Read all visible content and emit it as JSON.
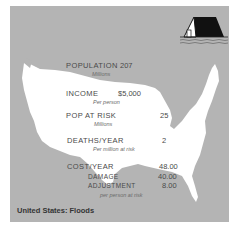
{
  "title": "United States: Floods",
  "icon": "flooded-house-icon",
  "colors": {
    "background": "#b4b4b4",
    "map": "#ffffff",
    "text": "#4a4a4a"
  },
  "stats": {
    "population": {
      "label": "POPULATION",
      "sub": "Millions",
      "value": "207"
    },
    "income": {
      "label": "INCOME",
      "sub": "Per person",
      "value": "$5,000"
    },
    "pop_at_risk": {
      "label": "POP AT RISK",
      "sub": "Millions",
      "value": "25"
    },
    "deaths": {
      "label": "DEATHS/YEAR",
      "sub": "Per million at risk",
      "value": "2"
    },
    "cost": {
      "label": "COST/YEAR",
      "value": "48.00"
    },
    "damage": {
      "label": "DAMAGE",
      "value": "40.00"
    },
    "adjustment": {
      "label": "ADJUSTMENT",
      "value": "8.00"
    },
    "cost_sub": "per person at risk"
  }
}
